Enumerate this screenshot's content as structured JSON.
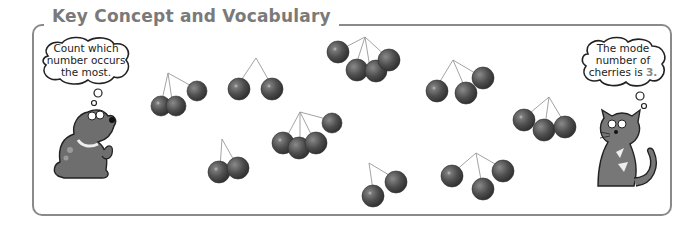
{
  "panel": {
    "title": "Key Concept and Vocabulary"
  },
  "dog_bubble": {
    "lines": [
      "Count which",
      "number occurs",
      "the most."
    ]
  },
  "cat_bubble": {
    "lines": [
      "The mode",
      "number of",
      "cherries is"
    ],
    "value": "3."
  },
  "cherry_groups": [
    {
      "id": 1,
      "count": 3
    },
    {
      "id": 2,
      "count": 2
    },
    {
      "id": 3,
      "count": 4
    },
    {
      "id": 4,
      "count": 3
    },
    {
      "id": 5,
      "count": 3
    },
    {
      "id": 6,
      "count": 4
    },
    {
      "id": 7,
      "count": 2
    },
    {
      "id": 8,
      "count": 2
    },
    {
      "id": 9,
      "count": 3
    }
  ],
  "colors": {
    "frame": "#8a8a8a",
    "title": "#7a7a7a",
    "cherry": "#555555",
    "animal": "#6e6e6e"
  }
}
